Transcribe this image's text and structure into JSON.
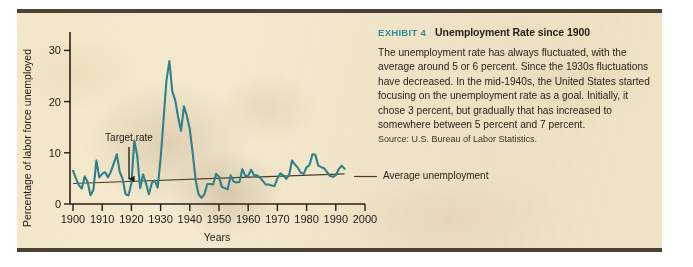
{
  "exhibit": {
    "label": "EXHIBIT 4",
    "title": "Unemployment Rate since 1900",
    "body": "The unemployment rate has always fluctuated, with the average around 5 or 6 percent. Since the 1930s fluctuations have decreased. In the mid-1940s, the United States started focusing on the unemployment rate as a goal. Initially, it chose 3 percent, but gradually that has increased to somewhere between 5 percent and 7 percent.",
    "source": "Source: U.S. Bureau of Labor Statistics.",
    "label_color": "#2f8c97",
    "panel_color": "#f3e9cf",
    "border_color": "#4a4234"
  },
  "chart_data": {
    "type": "line",
    "title": "Unemployment Rate since 1900",
    "xlabel": "Years",
    "ylabel": "Percentage of labor force unemployed",
    "xlim": [
      1900,
      2000
    ],
    "ylim": [
      0,
      33
    ],
    "xticks": [
      1900,
      1910,
      1920,
      1930,
      1940,
      1950,
      1960,
      1970,
      1980,
      1990,
      2000
    ],
    "yticks": [
      0,
      10,
      20,
      30
    ],
    "grid": false,
    "legend": "none",
    "line_color": "#2f818c",
    "annotations": [
      {
        "name": "target-rate",
        "text": "Target rate",
        "x": 1919,
        "y": 4.2
      },
      {
        "name": "average-unemployment",
        "text": "Average unemployment",
        "x": 1994,
        "y": 5.7
      }
    ],
    "series": [
      {
        "name": "Unemployment rate",
        "x": [
          1900,
          1901,
          1902,
          1903,
          1904,
          1905,
          1906,
          1907,
          1908,
          1909,
          1910,
          1911,
          1912,
          1913,
          1914,
          1915,
          1916,
          1917,
          1918,
          1919,
          1920,
          1921,
          1922,
          1923,
          1924,
          1925,
          1926,
          1927,
          1928,
          1929,
          1930,
          1931,
          1932,
          1933,
          1934,
          1935,
          1936,
          1937,
          1938,
          1939,
          1940,
          1941,
          1942,
          1943,
          1944,
          1945,
          1946,
          1947,
          1948,
          1949,
          1950,
          1951,
          1952,
          1953,
          1954,
          1955,
          1956,
          1957,
          1958,
          1959,
          1960,
          1961,
          1962,
          1963,
          1964,
          1965,
          1966,
          1967,
          1968,
          1969,
          1970,
          1971,
          1972,
          1973,
          1974,
          1975,
          1976,
          1977,
          1978,
          1979,
          1980,
          1981,
          1982,
          1983,
          1984,
          1985,
          1986,
          1987,
          1988,
          1989,
          1990,
          1991,
          1992,
          1993
        ],
        "values": [
          6.5,
          5.0,
          3.7,
          3.0,
          5.4,
          4.3,
          1.7,
          2.8,
          8.5,
          5.2,
          5.9,
          6.2,
          5.2,
          6.4,
          8.0,
          9.7,
          6.3,
          4.9,
          1.9,
          1.7,
          4.0,
          12.4,
          9.4,
          3.1,
          5.8,
          4.0,
          1.9,
          4.1,
          4.6,
          3.2,
          8.9,
          16.3,
          24.1,
          27.9,
          22.0,
          20.3,
          17.0,
          14.3,
          19.1,
          17.2,
          14.6,
          9.9,
          4.7,
          1.9,
          1.2,
          1.9,
          3.9,
          3.9,
          3.8,
          5.9,
          5.3,
          3.3,
          3.1,
          2.9,
          5.6,
          4.4,
          4.2,
          4.3,
          6.8,
          5.5,
          5.5,
          6.7,
          5.6,
          5.6,
          5.2,
          4.5,
          3.8,
          3.8,
          3.6,
          3.5,
          5.0,
          6.0,
          5.6,
          4.9,
          5.6,
          8.5,
          7.7,
          7.1,
          6.1,
          5.9,
          7.2,
          7.6,
          9.7,
          9.6,
          7.5,
          7.2,
          7.0,
          6.2,
          5.5,
          5.3,
          5.6,
          6.8,
          7.5,
          6.9
        ]
      },
      {
        "name": "Average unemployment trend",
        "x": [
          1900,
          1993
        ],
        "values": [
          4.0,
          5.9
        ]
      }
    ]
  }
}
